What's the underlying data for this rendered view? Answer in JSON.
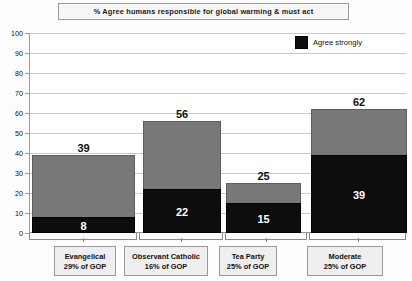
{
  "chart_data": {
    "type": "bar",
    "title": "% Agree humans responsible for global warming & must act",
    "xlabel": "",
    "ylabel": "",
    "ylim": [
      0,
      100
    ],
    "ytick_step": 10,
    "yticks": [
      "0",
      "10",
      "20",
      "30",
      "40",
      "50",
      "60",
      "70",
      "80",
      "90",
      "100"
    ],
    "grid": true,
    "stacked": true,
    "legend_position": "top-right",
    "categories": [
      "Evangelical",
      "Observant Catholic",
      "Tea Party",
      "Moderate"
    ],
    "category_sublabels": [
      "29% of GOP",
      "16% of GOP",
      "25% of GOP",
      "25% of GOP"
    ],
    "series": [
      {
        "name": "Agree (total)",
        "values": [
          39,
          56,
          25,
          62
        ],
        "color": "#787878"
      },
      {
        "name": "Agree strongly",
        "values": [
          8,
          22,
          15,
          39
        ],
        "color": "#0d0d0d"
      }
    ],
    "legend": [
      {
        "label": "Agree strongly",
        "color": "#0d0d0d"
      }
    ],
    "bar_total_labels": [
      "39",
      "56",
      "25",
      "62"
    ],
    "bar_strong_labels": [
      "8",
      "22",
      "15",
      "39"
    ]
  }
}
